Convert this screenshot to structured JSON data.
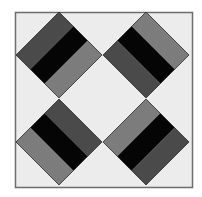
{
  "colors": {
    "page": "#ffffff",
    "background": "#ececec",
    "frame": "#6e6e6e",
    "dark_gray": "#4a4a4a",
    "mid_gray": "#7c7c7c",
    "black": "#050505",
    "outline": "#2a2a2a"
  },
  "frame": {
    "x": 15,
    "y": 12,
    "w": 177,
    "h": 175
  },
  "diamonds": [
    {
      "name": "top-left",
      "cx": 59,
      "cy": 55,
      "r": 43,
      "orientation": "nw-se",
      "bands": [
        "dark_gray",
        "black",
        "mid_gray"
      ]
    },
    {
      "name": "top-right",
      "cx": 146,
      "cy": 55,
      "r": 43,
      "orientation": "ne-sw",
      "bands": [
        "mid_gray",
        "black",
        "dark_gray"
      ]
    },
    {
      "name": "bottom-left",
      "cx": 59,
      "cy": 142,
      "r": 43,
      "orientation": "ne-sw",
      "bands": [
        "dark_gray",
        "black",
        "mid_gray"
      ]
    },
    {
      "name": "bottom-right",
      "cx": 146,
      "cy": 142,
      "r": 43,
      "orientation": "nw-se",
      "bands": [
        "mid_gray",
        "black",
        "dark_gray"
      ]
    }
  ]
}
